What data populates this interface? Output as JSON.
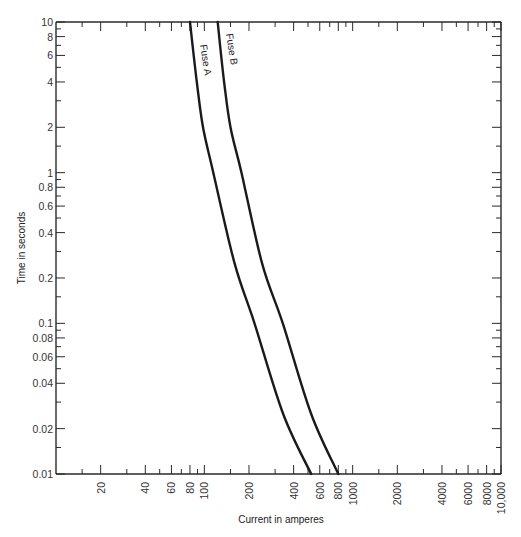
{
  "chart_data": {
    "type": "line",
    "title": "",
    "xlabel": "Current in amperes",
    "ylabel": "Time in seconds",
    "xscale": "log",
    "yscale": "log",
    "xlim": [
      10,
      10000
    ],
    "ylim": [
      0.01,
      10
    ],
    "grid": false,
    "legend": "inline labels along curves",
    "x_tick_labels": [
      {
        "value": 20,
        "label": "20"
      },
      {
        "value": 40,
        "label": "40"
      },
      {
        "value": 60,
        "label": "60"
      },
      {
        "value": 80,
        "label": "80"
      },
      {
        "value": 100,
        "label": "100"
      },
      {
        "value": 200,
        "label": "200"
      },
      {
        "value": 400,
        "label": "400"
      },
      {
        "value": 600,
        "label": "600"
      },
      {
        "value": 800,
        "label": "800"
      },
      {
        "value": 1000,
        "label": "1000"
      },
      {
        "value": 2000,
        "label": "2000"
      },
      {
        "value": 4000,
        "label": "4000"
      },
      {
        "value": 6000,
        "label": "6000"
      },
      {
        "value": 8000,
        "label": "8000"
      },
      {
        "value": 10000,
        "label": "10,000"
      }
    ],
    "x_minor_ticks": [
      15,
      30,
      50,
      70,
      90,
      150,
      300,
      500,
      700,
      900,
      1500,
      3000,
      5000,
      7000,
      9000
    ],
    "y_tick_labels": [
      {
        "value": 10,
        "label": "10"
      },
      {
        "value": 8,
        "label": "8"
      },
      {
        "value": 6,
        "label": "6"
      },
      {
        "value": 4,
        "label": "4"
      },
      {
        "value": 2,
        "label": "2"
      },
      {
        "value": 1,
        "label": "1"
      },
      {
        "value": 0.8,
        "label": "0.8"
      },
      {
        "value": 0.6,
        "label": "0.6"
      },
      {
        "value": 0.4,
        "label": "0.4"
      },
      {
        "value": 0.2,
        "label": "0.2"
      },
      {
        "value": 0.1,
        "label": "0.1"
      },
      {
        "value": 0.08,
        "label": "0.08"
      },
      {
        "value": 0.06,
        "label": "0.06"
      },
      {
        "value": 0.04,
        "label": "0.04"
      },
      {
        "value": 0.02,
        "label": "0.02"
      },
      {
        "value": 0.01,
        "label": "0.01"
      }
    ],
    "y_minor_ticks": [
      9,
      7,
      5,
      3,
      1.5,
      0.9,
      0.7,
      0.5,
      0.3,
      0.15,
      0.09,
      0.07,
      0.05,
      0.03,
      0.015
    ],
    "series": [
      {
        "name": "Fuse A",
        "points": [
          {
            "current": 80,
            "time": 10
          },
          {
            "current": 89,
            "time": 4
          },
          {
            "current": 98,
            "time": 2
          },
          {
            "current": 115,
            "time": 1
          },
          {
            "current": 160,
            "time": 0.25
          },
          {
            "current": 218,
            "time": 0.1
          },
          {
            "current": 340,
            "time": 0.025
          },
          {
            "current": 525,
            "time": 0.01
          }
        ]
      },
      {
        "name": "Fuse B",
        "points": [
          {
            "current": 123,
            "time": 10
          },
          {
            "current": 136,
            "time": 4
          },
          {
            "current": 150,
            "time": 2
          },
          {
            "current": 178,
            "time": 1
          },
          {
            "current": 245,
            "time": 0.25
          },
          {
            "current": 338,
            "time": 0.1
          },
          {
            "current": 525,
            "time": 0.025
          },
          {
            "current": 800,
            "time": 0.01
          }
        ]
      }
    ]
  },
  "labels": {
    "x_axis_title": "Current in amperes",
    "y_axis_title": "Time in seconds",
    "fuse_a": "Fuse A",
    "fuse_b": "Fuse B"
  }
}
